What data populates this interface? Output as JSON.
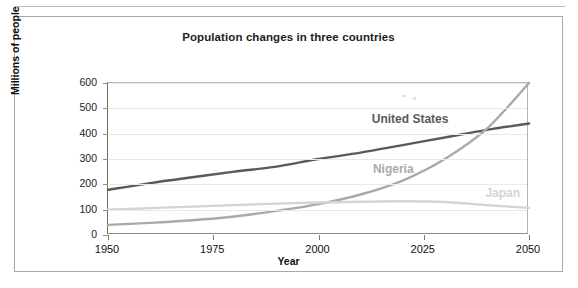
{
  "chart_data": {
    "type": "line",
    "title": "Population changes in three countries",
    "xlabel": "Year",
    "ylabel": "Millions of people",
    "xlim": [
      1950,
      2050
    ],
    "ylim": [
      0,
      600
    ],
    "xticks": [
      1950,
      1975,
      2000,
      2025,
      2050
    ],
    "yticks": [
      0,
      100,
      200,
      300,
      400,
      500,
      600
    ],
    "grid": "horizontal",
    "legend": "inline-labels",
    "x": [
      1950,
      1960,
      1970,
      1980,
      1990,
      2000,
      2010,
      2020,
      2030,
      2040,
      2050
    ],
    "series": [
      {
        "name": "United States",
        "color": "#5a5a5a",
        "values": [
          178,
          205,
          228,
          250,
          270,
          300,
          325,
          355,
          385,
          415,
          440
        ],
        "label_x": 2022,
        "label_y": 455
      },
      {
        "name": "Nigeria",
        "color": "#a9a9a9",
        "values": [
          40,
          48,
          58,
          73,
          95,
          122,
          160,
          215,
          300,
          420,
          600
        ],
        "label_x": 2018,
        "label_y": 258
      },
      {
        "name": "Japan",
        "color": "#d4d4d4",
        "values": [
          100,
          106,
          112,
          118,
          124,
          128,
          131,
          133,
          130,
          118,
          107
        ],
        "label_x": 2044,
        "label_y": 162
      }
    ]
  },
  "axis": {
    "ytick_labels": [
      "600",
      "500",
      "400",
      "300",
      "200",
      "100",
      "0"
    ],
    "xtick_labels": [
      "1950",
      "1975",
      "2000",
      "2025",
      "2050"
    ],
    "x_title": "Year",
    "y_title": "Millions of people"
  }
}
